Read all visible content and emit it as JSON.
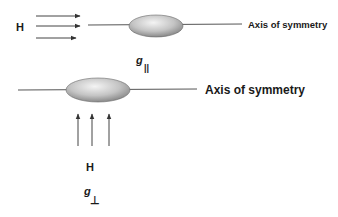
{
  "diagram": {
    "top": {
      "field_label": "H",
      "axis_label": "Axis of symmetry",
      "g_label": "g",
      "g_subscript": "||",
      "field_direction": "parallel to axis",
      "arrow_count": 3
    },
    "bottom": {
      "field_label": "H",
      "axis_label": "Axis of symmetry",
      "g_label": "g",
      "g_subscript": "⊥",
      "field_direction": "perpendicular to axis",
      "arrow_count": 3
    },
    "colors": {
      "line": "#555555",
      "ellipse_light": "#f2f2f2",
      "ellipse_dark": "#8a8a8a",
      "text": "#1a1a1a"
    }
  }
}
